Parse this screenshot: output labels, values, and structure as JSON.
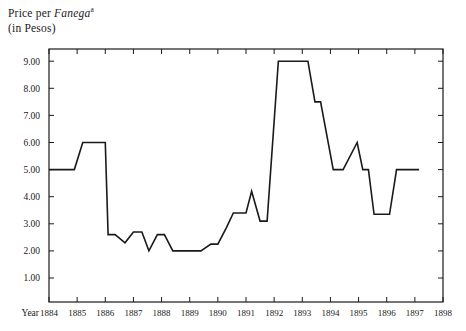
{
  "chart_data": {
    "type": "line",
    "title": "Price per Fanega",
    "title_superscript": "a",
    "subtitle": "(in Pesos)",
    "xlabel": "Year",
    "ylabel": "",
    "xlim": [
      1884,
      1898
    ],
    "ylim": [
      0.0,
      9.6
    ],
    "grid": false,
    "legend": "none",
    "x_tick_labels": [
      "1884",
      "1885",
      "1886",
      "1887",
      "1888",
      "1889",
      "1890",
      "1891",
      "1892",
      "1893",
      "1894",
      "1895",
      "1896",
      "1897",
      "1898"
    ],
    "x_ticks": [
      1884,
      1885,
      1886,
      1887,
      1888,
      1889,
      1890,
      1891,
      1892,
      1893,
      1894,
      1895,
      1896,
      1897,
      1898
    ],
    "y_tick_labels": [
      "1.00",
      "2.00",
      "3.00",
      "4.00",
      "5.00",
      "6.00",
      "7.00",
      "8.00",
      "9.00"
    ],
    "y_ticks": [
      1,
      2,
      3,
      4,
      5,
      6,
      7,
      8,
      9
    ],
    "series": [
      {
        "name": "Price per Fanega (Pesos)",
        "color": "#1a1a1a",
        "x": [
          1884.0,
          1884.9,
          1885.2,
          1886.0,
          1886.1,
          1886.35,
          1886.7,
          1887.0,
          1887.3,
          1887.55,
          1887.85,
          1888.1,
          1888.4,
          1889.4,
          1889.75,
          1890.0,
          1890.3,
          1890.55,
          1890.8,
          1891.0,
          1891.2,
          1891.5,
          1891.75,
          1892.15,
          1892.3,
          1893.2,
          1893.45,
          1893.65,
          1894.1,
          1894.45,
          1894.95,
          1895.15,
          1895.35,
          1895.55,
          1895.8,
          1896.1,
          1896.35,
          1897.15
        ],
        "y": [
          5.0,
          5.0,
          6.0,
          6.0,
          2.6,
          2.6,
          2.3,
          2.7,
          2.7,
          2.0,
          2.6,
          2.6,
          2.0,
          2.0,
          2.25,
          2.25,
          2.85,
          3.4,
          3.4,
          3.4,
          4.2,
          3.1,
          3.1,
          9.0,
          9.0,
          9.0,
          7.5,
          7.5,
          5.0,
          5.0,
          6.0,
          5.0,
          5.0,
          3.35,
          3.35,
          3.35,
          5.0,
          5.0
        ]
      }
    ]
  }
}
